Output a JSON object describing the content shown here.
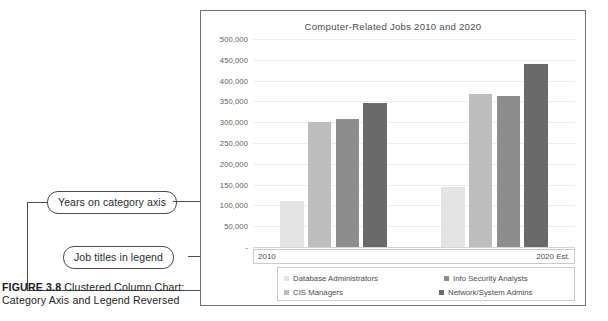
{
  "figure": {
    "number_label": "FIGURE 3.8",
    "caption_text": " Clustered Column Chart: Category Axis and Legend Reversed"
  },
  "callouts": [
    {
      "id": "years-on-category-axis",
      "text": "Years on category axis"
    },
    {
      "id": "job-titles-in-legend",
      "text": "Job titles in legend"
    }
  ],
  "chart_data": {
    "type": "bar",
    "title": "Computer-Related Jobs 2010 and 2020",
    "xlabel": "",
    "ylabel": "",
    "categories": [
      "2010",
      "2020 Est."
    ],
    "series": [
      {
        "name": "Database Administrators",
        "color": "#e3e3e3",
        "values": [
          110000,
          145000
        ]
      },
      {
        "name": "CIS Managers",
        "color": "#bdbdbd",
        "values": [
          300000,
          367000
        ]
      },
      {
        "name": "Info Security Analysts",
        "color": "#8d8d8d",
        "values": [
          307000,
          362000
        ]
      },
      {
        "name": "Network/System Admins",
        "color": "#6a6a6a",
        "values": [
          347000,
          441000
        ]
      }
    ],
    "ylim": [
      0,
      500000
    ],
    "ytick_step": 50000,
    "ytick_labels": [
      "500,000",
      "450,000",
      "400,000",
      "350,000",
      "300,000",
      "250,000",
      "200,000",
      "150,000",
      "100,000",
      "50,000",
      "-"
    ],
    "grid": true,
    "legend_position": "bottom",
    "legend_entries": [
      "Database Administrators",
      "Info Security Analysts",
      "CIS Managers",
      "Network/System Admins"
    ]
  }
}
